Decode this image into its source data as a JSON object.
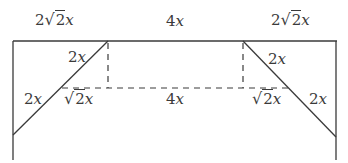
{
  "diagram": {
    "stroke_color": "#3a3a3a",
    "labels": {
      "top_left": {
        "coef": "2",
        "radicand": "2",
        "var": "x"
      },
      "top_middle": {
        "coef": "4",
        "var": "x"
      },
      "top_right": {
        "coef": "2",
        "radicand": "2",
        "var": "x"
      },
      "left_diag_upper": {
        "coef": "2",
        "var": "x"
      },
      "left_diag_outer": {
        "coef": "2",
        "var": "x"
      },
      "left_dashed_segment": {
        "radicand": "2",
        "var": "x"
      },
      "middle_dashed": {
        "coef": "4",
        "var": "x"
      },
      "right_dashed_segment": {
        "radicand": "2",
        "var": "x"
      },
      "right_diag_upper": {
        "coef": "2",
        "var": "x"
      },
      "right_diag_outer": {
        "coef": "2",
        "var": "x"
      }
    }
  }
}
